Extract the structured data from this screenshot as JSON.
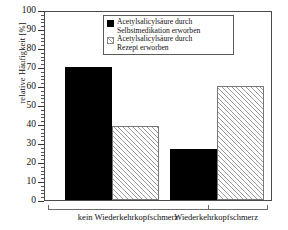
{
  "chart_data": {
    "type": "bar",
    "title": "",
    "xlabel": "",
    "ylabel": "relative Häufigkeit [%]",
    "categories": [
      "kein Wiederkehrkopfschmerz",
      "Wiederkehrkopfschmerz"
    ],
    "series": [
      {
        "name": "Acetylsalicylsäure durch Selbstmedikation erworben",
        "values": [
          70,
          27
        ],
        "fill": "solid",
        "color": "#000000"
      },
      {
        "name": "Acetylsalicylsäure durch Rezept erworben",
        "values": [
          39,
          60
        ],
        "fill": "hatched",
        "color": "#ffffff"
      }
    ],
    "ylim": [
      0,
      100
    ],
    "ytick_major": [
      0,
      10,
      20,
      30,
      40,
      50,
      60,
      70,
      80,
      90,
      100
    ],
    "ytick_minor_step": 2,
    "grid": false,
    "legend_position": "top-right"
  },
  "axis": {
    "y_label": "relative Häufigkeit [%]",
    "y_ticks": [
      "0",
      "10",
      "20",
      "30",
      "40",
      "50",
      "60",
      "70",
      "80",
      "90",
      "100"
    ]
  },
  "legend": {
    "entries": [
      {
        "label": "Acetylsalicylsäure durch\nSelbstmedikation erworben",
        "swatch": "solid-black-square"
      },
      {
        "label": "Acetylsalicylsäure durch\nRezept erworben",
        "swatch": "hatched-square"
      }
    ]
  },
  "groups": [
    {
      "label": "kein Wiederkehrkopfschmerz"
    },
    {
      "label": "Wiederkehrkopfschmerz"
    }
  ]
}
